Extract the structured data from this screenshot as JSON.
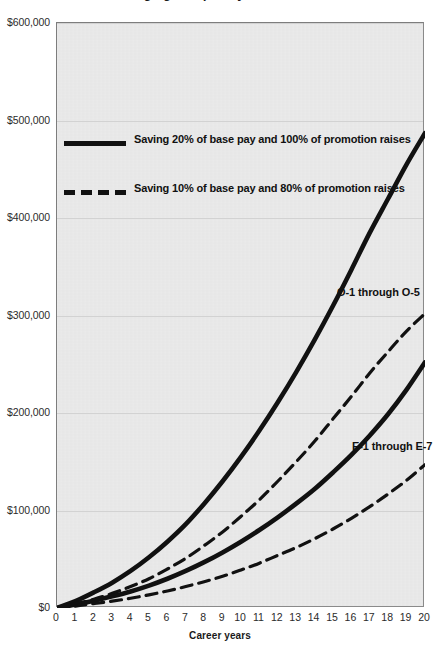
{
  "title": "Savings grow quickly over a career",
  "axis": {
    "x_title": "Career years",
    "x_ticks": [
      "0",
      "1",
      "2",
      "3",
      "4",
      "5",
      "6",
      "7",
      "8",
      "9",
      "10",
      "11",
      "12",
      "13",
      "14",
      "15",
      "16",
      "17",
      "18",
      "19",
      "20"
    ],
    "y_ticks": [
      "$0",
      "$100,000",
      "$200,000",
      "$300,000",
      "$400,000",
      "$500,000",
      "$600,000"
    ]
  },
  "legend": {
    "items": [
      {
        "style": "solid",
        "label": "Saving 20% of base pay and 100% of promotion raises"
      },
      {
        "style": "dashed",
        "label": "Saving 10% of base pay and 80% of promotion raises"
      }
    ]
  },
  "annotations": {
    "officer": "O-1 through O-5",
    "enlisted": "E-1 through E-7"
  },
  "colors": {
    "plot_background": "#e8e8e8",
    "frame": "#8a8a8a",
    "gridline": "#d2d2d2",
    "line": "#111111",
    "text": "#1a1a1a"
  },
  "chart_data": {
    "type": "line",
    "title": "Savings grow quickly over a career",
    "xlabel": "Career years",
    "ylabel": "",
    "xlim": [
      0,
      20
    ],
    "ylim": [
      0,
      600000
    ],
    "grid": true,
    "legend_position": "upper-left-inside",
    "x": [
      0,
      1,
      2,
      3,
      4,
      5,
      6,
      7,
      8,
      9,
      10,
      11,
      12,
      13,
      14,
      15,
      16,
      17,
      18,
      19,
      20
    ],
    "series": [
      {
        "name": "O-1 through O-5, saving 20% of base pay and 100% of promotion raises",
        "group": "O-1 through O-5",
        "style": "solid",
        "values": [
          0,
          7000,
          16000,
          26000,
          38000,
          52000,
          68000,
          86000,
          107000,
          130000,
          155000,
          182000,
          211000,
          242000,
          275000,
          310000,
          347000,
          385000,
          420000,
          455000,
          487000
        ]
      },
      {
        "name": "O-1 through O-5, saving 10% of base pay and 80% of promotion raises",
        "group": "O-1 through O-5",
        "style": "dashed",
        "values": [
          0,
          4000,
          9000,
          15000,
          22000,
          30000,
          40000,
          51000,
          64000,
          78000,
          94000,
          111000,
          130000,
          150000,
          171000,
          194000,
          217000,
          241000,
          263000,
          284000,
          302000
        ]
      },
      {
        "name": "E-1 through E-7, saving 20% of base pay and 100% of promotion raises",
        "group": "E-1 through E-7",
        "style": "solid",
        "values": [
          0,
          3500,
          7500,
          12000,
          17000,
          23000,
          30000,
          38000,
          47000,
          57000,
          68000,
          80000,
          93000,
          107000,
          122000,
          139000,
          157000,
          177000,
          199000,
          224000,
          252000
        ]
      },
      {
        "name": "E-1 through E-7, saving 10% of base pay and 80% of promotion raises",
        "group": "E-1 through E-7",
        "style": "dashed",
        "values": [
          0,
          2000,
          4500,
          7000,
          10000,
          13500,
          17500,
          22000,
          27000,
          32500,
          39000,
          46000,
          54000,
          62000,
          71000,
          81000,
          92000,
          104000,
          117000,
          131000,
          147000
        ]
      }
    ]
  }
}
